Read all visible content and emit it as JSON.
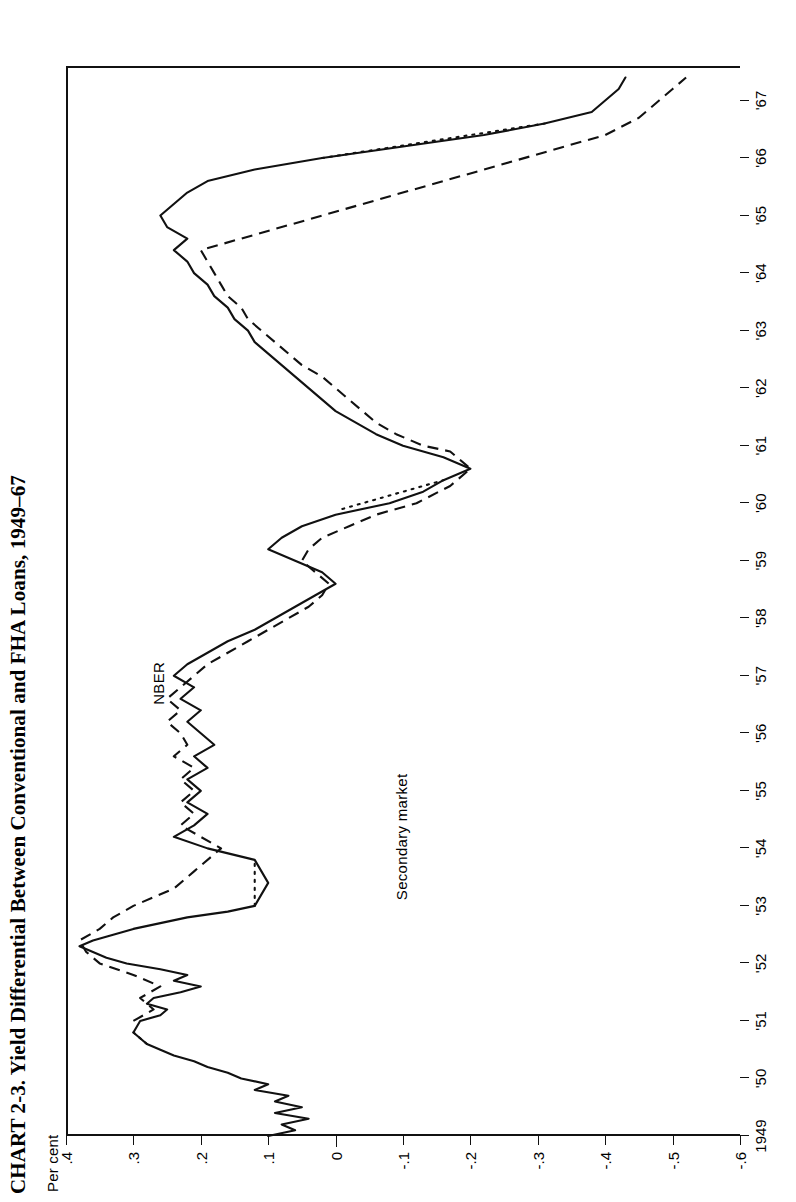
{
  "figure": {
    "title": "CHART 2-3. Yield Differential Between Conventional and FHA Loans, 1949–67",
    "unit_label": "Per cent"
  },
  "annotations": {
    "nber": "NBER",
    "secondary_market": "Secondary market"
  },
  "chart_data": {
    "type": "line",
    "title": "CHART 2-3. Yield Differential Between Conventional and FHA Loans, 1949–67",
    "xlabel": "",
    "ylabel": "Per cent",
    "ylim": [
      -0.6,
      0.4
    ],
    "xlim": [
      1949.0,
      1967.6
    ],
    "grid": false,
    "legend": "inline-annotations",
    "ytick_labels": [
      ".4",
      ".3",
      ".2",
      ".1",
      "0",
      "-.1",
      "-.2",
      "-.3",
      "-.4",
      "-.5",
      "-.6"
    ],
    "ytick_values": [
      0.4,
      0.3,
      0.2,
      0.1,
      0,
      -0.1,
      -0.2,
      -0.3,
      -0.4,
      -0.5,
      -0.6
    ],
    "xtick_labels": [
      "1949",
      "'50",
      "'51",
      "'52",
      "'53",
      "'54",
      "'55",
      "'56",
      "'57",
      "'58",
      "'59",
      "'60",
      "'61",
      "'62",
      "'63",
      "'64",
      "'65",
      "'66",
      "'67"
    ],
    "xtick_values": [
      1949,
      1950,
      1951,
      1952,
      1953,
      1954,
      1955,
      1956,
      1957,
      1958,
      1959,
      1960,
      1961,
      1962,
      1963,
      1964,
      1965,
      1966,
      1967
    ],
    "series": [
      {
        "name": "Secondary market",
        "style": "solid",
        "x": [
          1949.0,
          1949.1,
          1949.2,
          1949.3,
          1949.4,
          1949.5,
          1949.6,
          1949.7,
          1949.8,
          1949.9,
          1950.0,
          1950.1,
          1950.2,
          1950.3,
          1950.4,
          1950.5,
          1950.6,
          1950.8,
          1951.0,
          1951.1,
          1951.2,
          1951.3,
          1951.4,
          1951.5,
          1951.6,
          1951.7,
          1951.8,
          1951.9,
          1952.0,
          1952.1,
          1952.2,
          1952.3,
          1952.4,
          1952.5,
          1952.6,
          1952.7,
          1952.8,
          1952.9,
          1953.0,
          1953.2,
          1953.4,
          1953.6,
          1953.8,
          1954.0,
          1954.2,
          1954.4,
          1954.6,
          1954.8,
          1955.0,
          1955.2,
          1955.4,
          1955.6,
          1955.8,
          1956.0,
          1956.2,
          1956.4,
          1956.6,
          1956.8,
          1957.0,
          1957.2,
          1957.4,
          1957.6,
          1957.8,
          1958.0,
          1958.2,
          1958.4,
          1958.6,
          1958.8,
          1959.0,
          1959.2,
          1959.4,
          1959.6,
          1959.8,
          1960.0,
          1960.2,
          1960.4,
          1960.6,
          1960.8,
          1961.0,
          1961.2,
          1961.4,
          1961.6,
          1961.8,
          1962.0,
          1962.2,
          1962.4,
          1962.6,
          1962.8,
          1963.0,
          1963.2,
          1963.4,
          1963.6,
          1963.8,
          1964.0,
          1964.2,
          1964.4,
          1964.6,
          1964.8,
          1965.0,
          1965.2,
          1965.4,
          1965.6,
          1965.8,
          1966.0,
          1966.2,
          1966.4,
          1966.6,
          1966.8,
          1967.0,
          1967.2,
          1967.4
        ],
        "y": [
          0.1,
          0.06,
          0.08,
          0.04,
          0.09,
          0.05,
          0.09,
          0.07,
          0.12,
          0.1,
          0.14,
          0.16,
          0.19,
          0.21,
          0.24,
          0.26,
          0.28,
          0.3,
          0.29,
          0.26,
          0.25,
          0.28,
          0.27,
          0.23,
          0.2,
          0.24,
          0.22,
          0.26,
          0.31,
          0.34,
          0.36,
          0.38,
          0.36,
          0.33,
          0.3,
          0.26,
          0.22,
          0.16,
          0.12,
          0.11,
          0.1,
          0.11,
          0.12,
          0.19,
          0.24,
          0.21,
          0.19,
          0.22,
          0.2,
          0.22,
          0.19,
          0.21,
          0.18,
          0.2,
          0.22,
          0.2,
          0.23,
          0.21,
          0.24,
          0.22,
          0.19,
          0.16,
          0.12,
          0.09,
          0.06,
          0.03,
          0.0,
          0.02,
          0.06,
          0.1,
          0.08,
          0.05,
          0.0,
          -0.08,
          -0.13,
          -0.16,
          -0.2,
          -0.16,
          -0.1,
          -0.06,
          -0.03,
          0.0,
          0.02,
          0.04,
          0.06,
          0.08,
          0.1,
          0.12,
          0.13,
          0.15,
          0.16,
          0.18,
          0.19,
          0.21,
          0.22,
          0.24,
          0.22,
          0.25,
          0.26,
          0.24,
          0.22,
          0.19,
          0.12,
          0.02,
          -0.1,
          -0.22,
          -0.31,
          -0.38,
          -0.4,
          -0.42,
          -0.43
        ],
        "note": "Solid line; short dotted gap in 1950 where data were interpolated."
      },
      {
        "name": "NBER",
        "style": "dashed",
        "x": [
          1951.0,
          1951.2,
          1951.4,
          1951.6,
          1951.8,
          1952.0,
          1952.2,
          1952.4,
          1952.6,
          1952.8,
          1953.0,
          1953.3,
          1953.6,
          1953.9,
          1954.0,
          1954.2,
          1954.4,
          1954.6,
          1954.8,
          1955.0,
          1955.2,
          1955.4,
          1955.6,
          1955.8,
          1956.0,
          1956.2,
          1956.4,
          1956.6,
          1956.8,
          1957.0,
          1957.2,
          1957.4,
          1957.6,
          1957.8,
          1958.0,
          1958.2,
          1958.4,
          1958.6,
          1958.8,
          1959.0,
          1959.2,
          1959.4,
          1959.6,
          1959.8,
          1960.0,
          1960.3,
          1960.6,
          1960.9,
          1961.0,
          1961.2,
          1961.4,
          1961.6,
          1961.8,
          1962.0,
          1962.2,
          1962.4,
          1962.6,
          1962.8,
          1963.0,
          1963.2,
          1963.4,
          1963.6,
          1963.8,
          1964.0,
          1964.2,
          1964.4,
          1966.4,
          1966.7,
          1967.0,
          1967.2,
          1967.4
        ],
        "y": [
          0.3,
          0.27,
          0.29,
          0.26,
          0.3,
          0.35,
          0.37,
          0.38,
          0.35,
          0.33,
          0.3,
          0.24,
          0.21,
          0.18,
          0.17,
          0.2,
          0.23,
          0.21,
          0.23,
          0.21,
          0.23,
          0.21,
          0.24,
          0.22,
          0.23,
          0.25,
          0.23,
          0.25,
          0.23,
          0.21,
          0.19,
          0.16,
          0.13,
          0.1,
          0.07,
          0.04,
          0.02,
          0.01,
          0.03,
          0.05,
          0.04,
          0.02,
          -0.02,
          -0.06,
          -0.12,
          -0.17,
          -0.2,
          -0.17,
          -0.13,
          -0.09,
          -0.06,
          -0.04,
          -0.02,
          0.0,
          0.02,
          0.05,
          0.07,
          0.09,
          0.11,
          0.13,
          0.14,
          0.16,
          0.17,
          0.18,
          0.19,
          0.2,
          -0.4,
          -0.45,
          -0.48,
          -0.5,
          -0.52
        ],
        "note": "Long-dash line; dotted where interpolated (1953, 1959-60, 1966-67)."
      }
    ]
  }
}
